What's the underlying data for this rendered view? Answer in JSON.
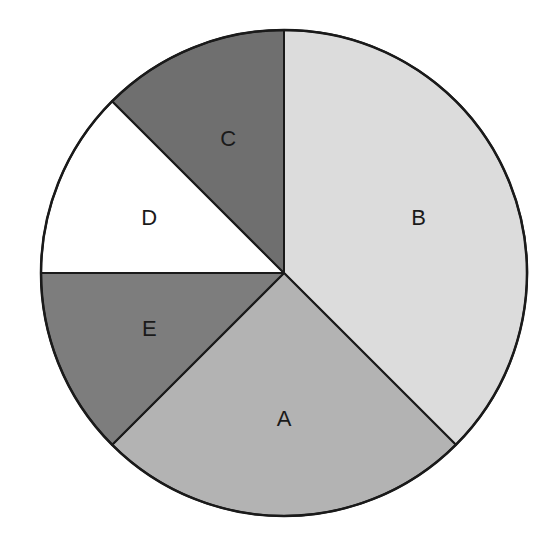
{
  "chart_data": {
    "type": "pie",
    "title": "",
    "start_angle_deg": 0,
    "direction": "clockwise",
    "categories": [
      "B",
      "A",
      "E",
      "D",
      "C"
    ],
    "values": [
      37.5,
      25,
      12.5,
      12.5,
      12.5
    ],
    "unit": "percent",
    "colors": [
      "#dcdcdc",
      "#b3b3b3",
      "#7d7d7d",
      "#ffffff",
      "#6f6f6f"
    ],
    "labels_inside": true,
    "legend": null
  },
  "geometry": {
    "cx": 284,
    "cy": 273,
    "r": 243,
    "label_radius_factor": 0.6
  }
}
